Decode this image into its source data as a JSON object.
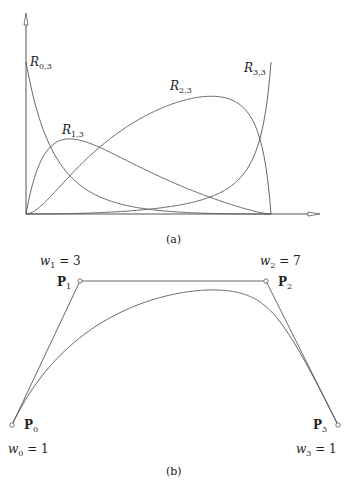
{
  "figure_a": {
    "caption": "(a)",
    "weights": [
      1,
      3,
      7,
      1
    ],
    "axis": {
      "origin": [
        26,
        214
      ],
      "x_end": 320,
      "y_top": 13,
      "x_unit_px": 245,
      "y_unit_px": 152
    },
    "curves": [
      {
        "name": "R",
        "sub": "0,3",
        "label_pos": [
          30,
          56
        ]
      },
      {
        "name": "R",
        "sub": "1,3",
        "label_pos": [
          62,
          124
        ]
      },
      {
        "name": "R",
        "sub": "2,3",
        "label_pos": [
          170,
          80
        ]
      },
      {
        "name": "R",
        "sub": "3,3",
        "label_pos": [
          244,
          62
        ]
      }
    ],
    "caption_pos": [
      166,
      233
    ]
  },
  "figure_b": {
    "caption": "(b)",
    "control_points": [
      {
        "label": "P",
        "sub": "0",
        "xy": [
          12,
          425
        ],
        "weight_label": "w",
        "weight_sub": "0",
        "weight": "1",
        "label_pos": [
          24,
          419
        ],
        "weight_pos": [
          8,
          443
        ]
      },
      {
        "label": "P",
        "sub": "1",
        "xy": [
          80,
          281
        ],
        "weight_label": "w",
        "weight_sub": "1",
        "weight": "3",
        "label_pos": [
          57,
          276
        ],
        "weight_pos": [
          40,
          255
        ]
      },
      {
        "label": "P",
        "sub": "2",
        "xy": [
          266,
          281
        ],
        "weight_label": "w",
        "weight_sub": "2",
        "weight": "7",
        "label_pos": [
          278,
          276
        ],
        "weight_pos": [
          260,
          255
        ]
      },
      {
        "label": "P",
        "sub": "3",
        "xy": [
          338,
          425
        ],
        "weight_label": "w",
        "weight_sub": "3",
        "weight": "1",
        "label_pos": [
          313,
          419
        ],
        "weight_pos": [
          296,
          443
        ]
      }
    ],
    "caption_pos": [
      166,
      465
    ]
  },
  "colors": {
    "line": "#555555",
    "text": "#222222"
  }
}
